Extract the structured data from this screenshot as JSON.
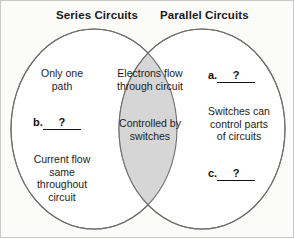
{
  "diagram": {
    "type": "venn",
    "title_left": "Series Circuits",
    "title_right": "Parallel Circuits",
    "colors": {
      "overlap_fill": "#d6d6d6",
      "circle_fill": "#ffffff",
      "circle_stroke": "#6e6e6e",
      "background": "#fbfbfa",
      "text": "#1c1c1c"
    },
    "left_circle": {
      "label": "Series Circuits",
      "items": [
        {
          "id": "only-one-path",
          "text": "Only one\npath"
        },
        {
          "id": "blank-b",
          "marker": "b.",
          "answer": "?"
        },
        {
          "id": "current-flow",
          "text": "Current flow\nsame\nthroughout\ncircuit"
        }
      ]
    },
    "overlap": {
      "items": [
        {
          "id": "electrons-flow",
          "text": "Electrons flow\nthrough circuit"
        },
        {
          "id": "controlled-by-switches",
          "text": "Controlled by\nswitches"
        }
      ]
    },
    "right_circle": {
      "label": "Parallel Circuits",
      "items": [
        {
          "id": "blank-a",
          "marker": "a.",
          "answer": "?"
        },
        {
          "id": "switches-control",
          "text": "Switches can\ncontrol parts\nof circuits"
        },
        {
          "id": "blank-c",
          "marker": "c.",
          "answer": "?"
        }
      ]
    }
  }
}
